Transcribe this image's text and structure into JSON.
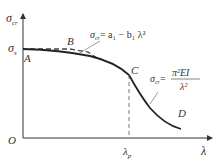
{
  "diagram": {
    "y_axis_label": "σ",
    "y_axis_sub": "cr",
    "x_axis_label": "λ",
    "origin_label": "O",
    "sigma_s_label": "σ",
    "sigma_s_sub": "s",
    "points": {
      "A": "A",
      "B": "B",
      "C": "C",
      "D": "D"
    },
    "lambda_p_label": "λ",
    "lambda_p_sub": "p",
    "formula_parabola": {
      "lhs": "σ",
      "lhs_sub": "cr",
      "rhs": "= a₁ − b₁ λ²"
    },
    "formula_euler": {
      "lhs": "σ",
      "lhs_sub": "cr",
      "eq": "=",
      "numerator": "π²EI",
      "denominator": "λ²"
    },
    "colors": {
      "curve": "#222222",
      "axis": "#333333",
      "dashed": "#444444",
      "leader": "#555555"
    }
  }
}
